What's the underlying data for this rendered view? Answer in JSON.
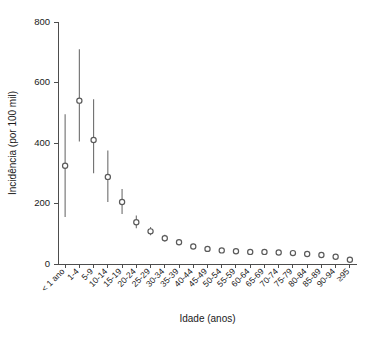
{
  "chart_data": {
    "type": "scatter",
    "title": "",
    "xlabel": "Idade (anos)",
    "ylabel": "Incidência (por 100 mil)",
    "ylim": [
      0,
      800
    ],
    "yticks": [
      0,
      200,
      400,
      600,
      800
    ],
    "grid": false,
    "legend": null,
    "marker_style": "open-circle",
    "error_bars": "vertical 95% interval",
    "categories": [
      "< 1 ano",
      "1-4",
      "5-9",
      "10-14",
      "15-19",
      "20-24",
      "25-29",
      "30-34",
      "35-39",
      "40-44",
      "45-49",
      "50-54",
      "55-59",
      "60-64",
      "65-69",
      "70-74",
      "75-79",
      "80-84",
      "85-89",
      "90-94",
      "≥95"
    ],
    "series": [
      {
        "name": "Incidência",
        "values": [
          325,
          540,
          410,
          288,
          205,
          138,
          108,
          85,
          72,
          58,
          50,
          45,
          42,
          40,
          40,
          38,
          36,
          33,
          30,
          24,
          14
        ],
        "lower": [
          155,
          405,
          300,
          205,
          165,
          118,
          95,
          74,
          63,
          50,
          44,
          40,
          37,
          35,
          35,
          33,
          31,
          28,
          24,
          18,
          7
        ],
        "upper": [
          495,
          710,
          545,
          375,
          248,
          160,
          122,
          97,
          82,
          67,
          57,
          51,
          47,
          45,
          45,
          43,
          41,
          38,
          36,
          31,
          22
        ]
      }
    ]
  }
}
